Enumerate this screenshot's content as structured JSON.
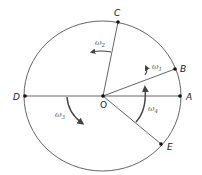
{
  "diagram": {
    "type": "rotation-circle",
    "center": {
      "label": "O",
      "x": 103,
      "y": 96
    },
    "circle": {
      "cx": 102.5,
      "cy": 96,
      "rx": 78.5,
      "ry": 75,
      "stroke": "#555555"
    },
    "points": [
      {
        "id": "A",
        "label": "A",
        "x": 180,
        "y": 96,
        "lx": 186,
        "ly": 100
      },
      {
        "id": "B",
        "label": "B",
        "x": 175,
        "y": 69,
        "lx": 180,
        "ly": 72
      },
      {
        "id": "C",
        "label": "C",
        "x": 118,
        "y": 22,
        "lx": 114,
        "ly": 16
      },
      {
        "id": "D",
        "label": "D",
        "x": 25,
        "y": 96,
        "lx": 13,
        "ly": 100
      },
      {
        "id": "E",
        "label": "E",
        "x": 161,
        "y": 144,
        "lx": 167,
        "ly": 150
      }
    ],
    "segments": [
      {
        "from": "D",
        "to": "A"
      },
      {
        "from": "O",
        "to": "B"
      },
      {
        "from": "O",
        "to": "C"
      },
      {
        "from": "O",
        "to": "E"
      }
    ],
    "angular_velocities": [
      {
        "symbol": "ω",
        "sub": "1",
        "x": 152,
        "y": 69,
        "direction": "counterclockwise"
      },
      {
        "symbol": "ω",
        "sub": "2",
        "x": 95,
        "y": 45,
        "direction": "counterclockwise"
      },
      {
        "symbol": "ω",
        "sub": "3",
        "x": 55,
        "y": 117,
        "direction": "clockwise"
      },
      {
        "symbol": "ω",
        "sub": "4",
        "x": 148,
        "y": 111,
        "direction": "counterclockwise"
      }
    ]
  }
}
